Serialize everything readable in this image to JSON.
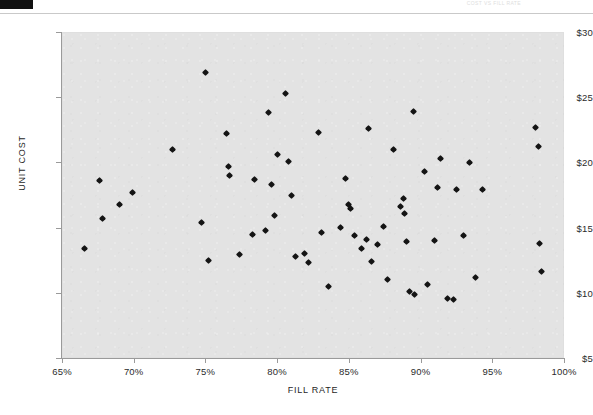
{
  "header": {
    "corner_mark_name": "scan-corner-mark",
    "faint_text": "COST VS FILL RATE"
  },
  "chart_data": {
    "type": "scatter",
    "title": "",
    "xlabel": "FILL RATE",
    "ylabel": "UNIT COST",
    "xlim": [
      65,
      100
    ],
    "ylim": [
      5,
      30
    ],
    "grid": false,
    "legend": null,
    "x_tick_labels": [
      "65%",
      "70%",
      "75%",
      "80%",
      "85%",
      "90%",
      "95%",
      "100%"
    ],
    "x_ticks": [
      65,
      70,
      75,
      80,
      85,
      90,
      95,
      100
    ],
    "y_tick_labels": [
      "$30",
      "$25",
      "$20",
      "$15",
      "$10",
      "$5"
    ],
    "y_ticks": [
      30,
      25,
      20,
      15,
      10,
      5
    ],
    "marker": "diamond",
    "marker_color": "#141414",
    "plot_background": "#e3e3e3",
    "series": [
      {
        "name": "Items",
        "points": [
          [
            66.6,
            13.4
          ],
          [
            67.6,
            18.6
          ],
          [
            67.8,
            15.7
          ],
          [
            69.0,
            16.8
          ],
          [
            69.9,
            17.7
          ],
          [
            72.7,
            21.0
          ],
          [
            74.7,
            15.4
          ],
          [
            75.0,
            26.9
          ],
          [
            75.2,
            12.5
          ],
          [
            76.5,
            22.2
          ],
          [
            76.6,
            19.7
          ],
          [
            76.7,
            19.0
          ],
          [
            77.4,
            12.9
          ],
          [
            78.3,
            14.5
          ],
          [
            78.4,
            18.7
          ],
          [
            79.2,
            14.8
          ],
          [
            79.4,
            23.8
          ],
          [
            79.6,
            18.3
          ],
          [
            79.8,
            15.9
          ],
          [
            80.0,
            20.6
          ],
          [
            80.6,
            25.3
          ],
          [
            80.8,
            20.1
          ],
          [
            81.0,
            17.5
          ],
          [
            81.3,
            12.8
          ],
          [
            81.9,
            13.0
          ],
          [
            82.2,
            12.3
          ],
          [
            82.9,
            22.3
          ],
          [
            83.1,
            14.6
          ],
          [
            83.6,
            10.5
          ],
          [
            84.4,
            15.0
          ],
          [
            84.8,
            18.8
          ],
          [
            85.0,
            16.8
          ],
          [
            85.1,
            16.5
          ],
          [
            85.4,
            14.4
          ],
          [
            85.9,
            13.4
          ],
          [
            86.2,
            14.1
          ],
          [
            86.4,
            22.6
          ],
          [
            86.6,
            12.4
          ],
          [
            87.0,
            13.7
          ],
          [
            87.4,
            15.1
          ],
          [
            87.7,
            11.0
          ],
          [
            88.1,
            21.0
          ],
          [
            88.6,
            16.6
          ],
          [
            88.8,
            17.2
          ],
          [
            88.9,
            16.1
          ],
          [
            89.0,
            13.9
          ],
          [
            89.2,
            10.1
          ],
          [
            89.5,
            23.9
          ],
          [
            89.6,
            9.9
          ],
          [
            90.3,
            19.3
          ],
          [
            90.5,
            10.6
          ],
          [
            91.0,
            14.0
          ],
          [
            91.2,
            18.1
          ],
          [
            91.4,
            20.3
          ],
          [
            91.9,
            9.6
          ],
          [
            92.3,
            9.5
          ],
          [
            92.5,
            17.9
          ],
          [
            93.0,
            14.4
          ],
          [
            93.4,
            20.0
          ],
          [
            93.8,
            11.2
          ],
          [
            94.3,
            17.9
          ],
          [
            98.0,
            22.7
          ],
          [
            98.2,
            21.2
          ],
          [
            98.3,
            13.8
          ],
          [
            98.4,
            11.6
          ]
        ]
      }
    ]
  }
}
